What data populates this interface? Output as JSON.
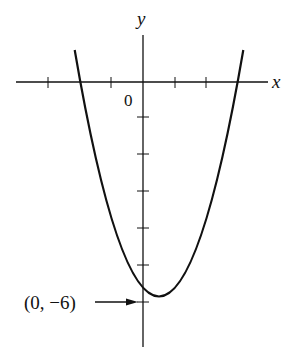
{
  "figure": {
    "type": "function-graph",
    "function": "y = x^2 - x - 6",
    "axes": {
      "x_label": "x",
      "y_label": "y",
      "origin_label": "0",
      "x_ticks": [
        -3,
        -1,
        1,
        2
      ],
      "y_ticks": [
        -1,
        -2,
        -3,
        -4,
        -5,
        -6
      ],
      "x_intercepts": [
        -2,
        3
      ],
      "vertex": [
        0.5,
        -6.25
      ]
    },
    "annotation": {
      "text": "(0, −6)",
      "point": [
        0,
        -6
      ]
    },
    "colors": {
      "stroke": "#111111",
      "background": "#ffffff"
    }
  }
}
